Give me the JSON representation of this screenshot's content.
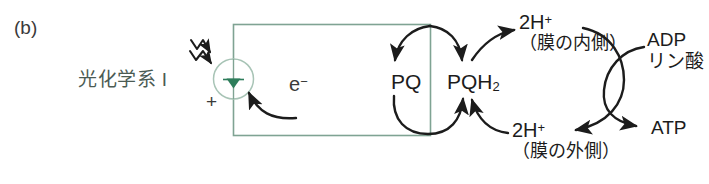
{
  "figure": {
    "panel_label": "(b)",
    "colors": {
      "membrane_green": "#7fa393",
      "photosystem_green": "#2e7d5b",
      "arrow_black": "#1c1c1c",
      "text_dark": "#1c1c1c",
      "label_green": "#4b5b53",
      "background": "#ffffff"
    }
  },
  "photosystem": {
    "name_label": "光化学系 I",
    "charge_label": "+",
    "light_icon": "light-wave-arrow-icon",
    "center_icon": "electron-minus-icon"
  },
  "electron": {
    "label": "e",
    "superscript": "−"
  },
  "quinone_cycle": {
    "pq": {
      "label": "PQ"
    },
    "pqh2": {
      "label": "PQH",
      "subscript": "2"
    }
  },
  "protons": {
    "inner": {
      "count": "2H",
      "superscript": "+",
      "location": "（膜の内側）"
    },
    "outer": {
      "count": "2H",
      "superscript": "+",
      "location": "（膜の外側）"
    }
  },
  "atp_synthase": {
    "substrate_line1": "ADP",
    "substrate_line2": "リン酸",
    "product": "ATP"
  }
}
